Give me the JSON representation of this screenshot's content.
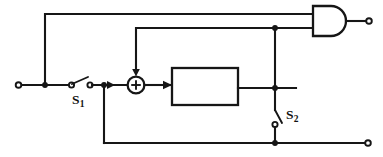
{
  "diagram": {
    "type": "block-diagram",
    "title": "",
    "background_color": "#ffffff",
    "line_color": "#161616",
    "width": 383,
    "height": 157,
    "labels": {
      "switch_1": "S",
      "switch_1_subscript": "1",
      "switch_2": "S",
      "switch_2_subscript": "2"
    },
    "components": [
      {
        "name": "input-terminal",
        "kind": "open-terminal",
        "x": 18,
        "y": 85
      },
      {
        "name": "input-branch-node",
        "kind": "junction-dot",
        "x": 45,
        "y": 85
      },
      {
        "name": "switch-s1",
        "kind": "spst-switch",
        "orientation": "horizontal",
        "x": 70,
        "y": 85,
        "label": "S1",
        "state": "open"
      },
      {
        "name": "feedback-branch-node",
        "kind": "junction-dot",
        "x": 104,
        "y": 85
      },
      {
        "name": "summing-junction",
        "kind": "summer",
        "sign": "+",
        "x": 136,
        "y": 85
      },
      {
        "name": "process-block",
        "kind": "rectangle",
        "x": 172,
        "y": 68,
        "width": 66,
        "height": 37,
        "text": ""
      },
      {
        "name": "block-output-node",
        "kind": "junction-dot",
        "x": 275,
        "y": 88
      },
      {
        "name": "upper-bus-node",
        "kind": "junction-dot",
        "x": 275,
        "y": 28
      },
      {
        "name": "switch-s2",
        "kind": "spst-switch",
        "orientation": "vertical",
        "x": 275,
        "y": 118,
        "label": "S2",
        "state": "open"
      },
      {
        "name": "bottom-rail-node",
        "kind": "junction-dot",
        "x": 275,
        "y": 143
      },
      {
        "name": "and-gate",
        "kind": "and-gate",
        "x": 313,
        "y": 21,
        "inputs": 2
      },
      {
        "name": "gate-output-terminal",
        "kind": "open-terminal",
        "x": 370,
        "y": 21
      },
      {
        "name": "bottom-output-terminal",
        "kind": "open-terminal",
        "x": 368,
        "y": 143
      }
    ],
    "wires": [
      {
        "name": "input-lead",
        "path": "18,85 to 70,85"
      },
      {
        "name": "input-riser",
        "path": "45,85 to 45,14"
      },
      {
        "name": "top-rail",
        "path": "45,14 to 313,14"
      },
      {
        "name": "s1-to-summer",
        "path": "88,85 to 124,85"
      },
      {
        "name": "summer-riser",
        "path": "136,72 to 136,28"
      },
      {
        "name": "second-rail",
        "path": "136,28 to 313,28"
      },
      {
        "name": "summer-to-block",
        "path": "148,85 to 172,85"
      },
      {
        "name": "block-to-bus",
        "path": "238,88 to 295,88"
      },
      {
        "name": "right-bus",
        "path": "275,28 to 275,110"
      },
      {
        "name": "s2-to-bottom-rail",
        "path": "275,126 to 275,143"
      },
      {
        "name": "bottom-rail",
        "path": "104,143 to 368,143"
      },
      {
        "name": "feedback-drop",
        "path": "104,85 to 104,143"
      },
      {
        "name": "gate-output-lead",
        "path": "345,21 to 370,21"
      }
    ]
  }
}
